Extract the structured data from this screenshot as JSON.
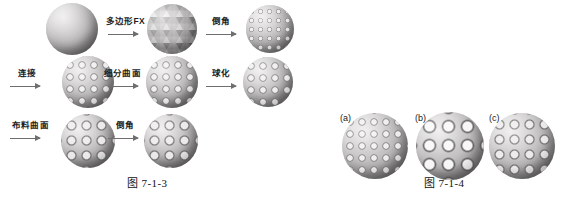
{
  "page": {
    "width": 562,
    "height": 202,
    "background": "#ffffff"
  },
  "figure_left": {
    "caption": "图 7-1-3",
    "caption_x": 127,
    "caption_y": 174,
    "operations": [
      {
        "name": "polygon-fx",
        "label": "多边形FX",
        "x": 106,
        "y": 14,
        "arrow_x": 108,
        "arrow_y": 34,
        "arrow_w": 30
      },
      {
        "name": "chamfer-top",
        "label": "倒角",
        "x": 212,
        "y": 14,
        "arrow_x": 206,
        "arrow_y": 34,
        "arrow_w": 30
      },
      {
        "name": "connect",
        "label": "连接",
        "x": 18,
        "y": 66,
        "arrow_x": 10,
        "arrow_y": 86,
        "arrow_w": 30
      },
      {
        "name": "subdivision",
        "label": "细分曲面",
        "x": 104,
        "y": 66,
        "arrow_x": 108,
        "arrow_y": 86,
        "arrow_w": 30
      },
      {
        "name": "spherify",
        "label": "球化",
        "x": 212,
        "y": 66,
        "arrow_x": 206,
        "arrow_y": 86,
        "arrow_w": 30
      },
      {
        "name": "cloth-surface",
        "label": "布料曲面",
        "x": 12,
        "y": 118,
        "arrow_x": 10,
        "arrow_y": 138,
        "arrow_w": 30
      },
      {
        "name": "chamfer-bottom",
        "label": "倒角",
        "x": 116,
        "y": 118,
        "arrow_x": 108,
        "arrow_y": 138,
        "arrow_w": 30
      }
    ],
    "spheres": [
      {
        "name": "sphere-smooth",
        "texture": "tex-smooth",
        "cx": 72,
        "cy": 29,
        "r": 26
      },
      {
        "name": "sphere-polygonized",
        "texture": "tex-facet",
        "cx": 172,
        "cy": 29,
        "r": 25
      },
      {
        "name": "sphere-chamfered-fine",
        "texture": "tex-fine",
        "cx": 270,
        "cy": 29,
        "r": 24
      },
      {
        "name": "sphere-connected",
        "texture": "tex-med",
        "cx": 88,
        "cy": 82,
        "r": 26
      },
      {
        "name": "sphere-subdivided",
        "texture": "tex-med",
        "cx": 172,
        "cy": 82,
        "r": 26
      },
      {
        "name": "sphere-spherified",
        "texture": "tex-med",
        "cx": 268,
        "cy": 82,
        "r": 25
      },
      {
        "name": "sphere-cloth",
        "texture": "tex-coarse",
        "cx": 88,
        "cy": 141,
        "r": 27
      },
      {
        "name": "sphere-final-chamfered",
        "texture": "tex-coarse",
        "cx": 171,
        "cy": 141,
        "r": 27
      }
    ]
  },
  "figure_right": {
    "caption": "图 7-1-4",
    "caption_x": 424,
    "caption_y": 174,
    "items": [
      {
        "name": "variant-a",
        "label": "(a)",
        "label_x": 340,
        "label_y": 116,
        "texture": "tex-med",
        "cx": 375,
        "cy": 146,
        "r": 33
      },
      {
        "name": "variant-b",
        "label": "(b)",
        "label_x": 415,
        "label_y": 116,
        "texture": "tex-big",
        "cx": 450,
        "cy": 146,
        "r": 34
      },
      {
        "name": "variant-c",
        "label": "(c)",
        "label_x": 489,
        "label_y": 116,
        "texture": "tex-coarse",
        "cx": 522,
        "cy": 146,
        "r": 33
      }
    ]
  }
}
